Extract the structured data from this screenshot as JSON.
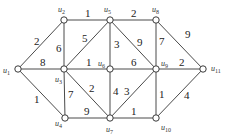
{
  "diagram": {
    "type": "weighted-undirected-graph",
    "nodes": [
      {
        "id": "u1",
        "label": "u",
        "sub": "1",
        "x": 18,
        "y": 69,
        "lx": 3,
        "ly": 73
      },
      {
        "id": "u2",
        "label": "u",
        "sub": "2",
        "x": 64,
        "y": 20,
        "lx": 58,
        "ly": 12
      },
      {
        "id": "u3",
        "label": "u",
        "sub": "3",
        "x": 64,
        "y": 69,
        "lx": 55,
        "ly": 82
      },
      {
        "id": "u4",
        "label": "u",
        "sub": "4",
        "x": 65,
        "y": 118,
        "lx": 55,
        "ly": 126
      },
      {
        "id": "u5",
        "label": "u",
        "sub": "5",
        "x": 110,
        "y": 20,
        "lx": 104,
        "ly": 12
      },
      {
        "id": "u6",
        "label": "u",
        "sub": "6",
        "x": 110,
        "y": 69,
        "lx": 98,
        "ly": 66
      },
      {
        "id": "u7",
        "label": "u",
        "sub": "7",
        "x": 110,
        "y": 118,
        "lx": 106,
        "ly": 132
      },
      {
        "id": "u8",
        "label": "u",
        "sub": "8",
        "x": 156,
        "y": 20,
        "lx": 152,
        "ly": 12
      },
      {
        "id": "u9",
        "label": "u",
        "sub": "9",
        "x": 156,
        "y": 69,
        "lx": 161,
        "ly": 66
      },
      {
        "id": "u10",
        "label": "u",
        "sub": "10",
        "x": 156,
        "y": 118,
        "lx": 161,
        "ly": 130
      },
      {
        "id": "u11",
        "label": "u",
        "sub": "11",
        "x": 203,
        "y": 69,
        "lx": 211,
        "ly": 71
      }
    ],
    "edges": [
      {
        "from": "u1",
        "to": "u2",
        "weight": "2",
        "lx": 34,
        "ly": 45
      },
      {
        "from": "u1",
        "to": "u3",
        "weight": "8",
        "lx": 40,
        "ly": 66
      },
      {
        "from": "u1",
        "to": "u4",
        "weight": "1",
        "lx": 34,
        "ly": 103
      },
      {
        "from": "u2",
        "to": "u5",
        "weight": "1",
        "lx": 85,
        "ly": 17
      },
      {
        "from": "u2",
        "to": "u3",
        "weight": "6",
        "lx": 56,
        "ly": 52
      },
      {
        "from": "u3",
        "to": "u5",
        "weight": "5",
        "lx": 82,
        "ly": 42
      },
      {
        "from": "u3",
        "to": "u6",
        "weight": "1",
        "lx": 86,
        "ly": 66
      },
      {
        "from": "u3",
        "to": "u4",
        "weight": "7",
        "lx": 68,
        "ly": 98
      },
      {
        "from": "u3",
        "to": "u7",
        "weight": "2",
        "lx": 89,
        "ly": 92
      },
      {
        "from": "u4",
        "to": "u7",
        "weight": "9",
        "lx": 84,
        "ly": 115
      },
      {
        "from": "u5",
        "to": "u8",
        "weight": "2",
        "lx": 131,
        "ly": 17
      },
      {
        "from": "u5",
        "to": "u6",
        "weight": "3",
        "lx": 114,
        "ly": 48
      },
      {
        "from": "u5",
        "to": "u9",
        "weight": "9",
        "lx": 137,
        "ly": 46
      },
      {
        "from": "u6",
        "to": "u9",
        "weight": "6",
        "lx": 131,
        "ly": 66
      },
      {
        "from": "u6",
        "to": "u7",
        "weight": "4",
        "lx": 113,
        "ly": 95
      },
      {
        "from": "u7",
        "to": "u9",
        "weight": "3",
        "lx": 124,
        "ly": 95
      },
      {
        "from": "u7",
        "to": "u10",
        "weight": "1",
        "lx": 131,
        "ly": 115
      },
      {
        "from": "u8",
        "to": "u9",
        "weight": "7",
        "lx": 159,
        "ly": 45
      },
      {
        "from": "u8",
        "to": "u11",
        "weight": "9",
        "lx": 185,
        "ly": 38
      },
      {
        "from": "u9",
        "to": "u11",
        "weight": "2",
        "lx": 179,
        "ly": 66
      },
      {
        "from": "u9",
        "to": "u10",
        "weight": "1",
        "lx": 159,
        "ly": 98
      },
      {
        "from": "u10",
        "to": "u11",
        "weight": "4",
        "lx": 184,
        "ly": 99
      }
    ]
  }
}
